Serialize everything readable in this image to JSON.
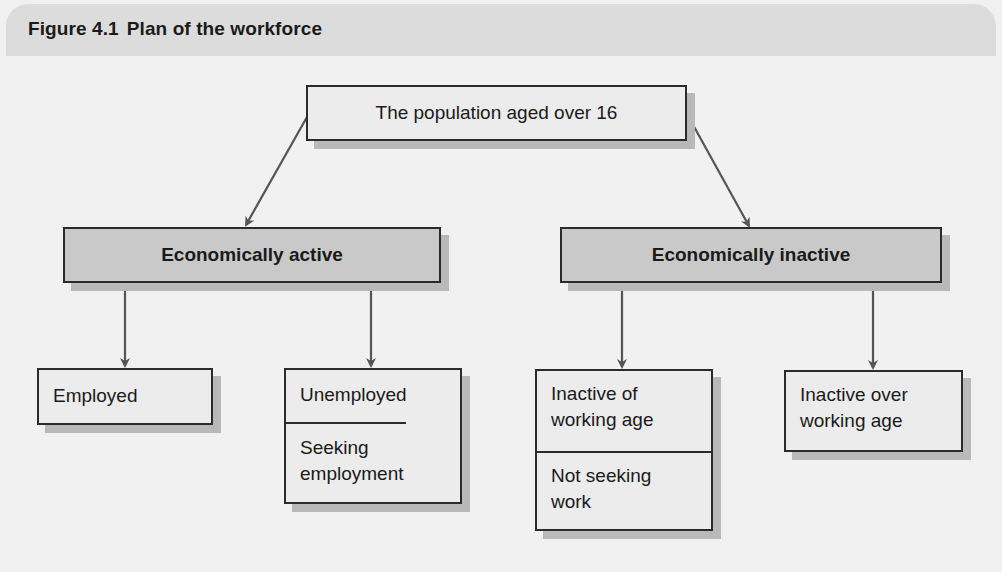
{
  "figure": {
    "number": "Figure 4.1",
    "title": "Plan of the workforce"
  },
  "nodes": {
    "root": {
      "label": "The population aged over 16"
    },
    "active": {
      "label": "Economically active"
    },
    "inactive": {
      "label": "Economically inactive"
    },
    "employed": {
      "label": "Employed"
    },
    "unemployed": {
      "label": "Unemployed",
      "sub": "Seeking employment"
    },
    "inactive_working_age": {
      "label": "Inactive of working age",
      "sub": "Not seeking work"
    },
    "inactive_over_age": {
      "label": "Inactive over working age"
    }
  },
  "edges": [
    {
      "from": "root",
      "to": "active"
    },
    {
      "from": "root",
      "to": "inactive"
    },
    {
      "from": "active",
      "to": "employed"
    },
    {
      "from": "active",
      "to": "unemployed"
    },
    {
      "from": "inactive",
      "to": "inactive_working_age"
    },
    {
      "from": "inactive",
      "to": "inactive_over_age"
    }
  ],
  "colors": {
    "background": "#f1f1f1",
    "title_band": "#dcdcdc",
    "box_light": "#ececec",
    "box_mid": "#c9c9c9",
    "arrow": "#555555",
    "border": "#2b2b2b"
  }
}
